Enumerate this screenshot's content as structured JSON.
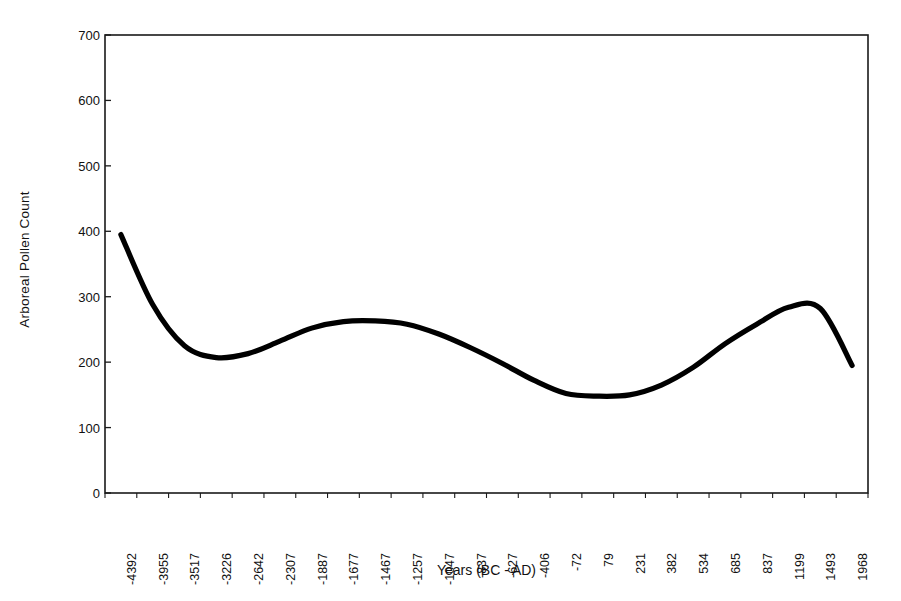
{
  "chart_data": {
    "type": "line",
    "title": "",
    "xlabel": "Years (BC - AD)",
    "ylabel": "Arboreal Pollen Count",
    "ylim": [
      0,
      700
    ],
    "y_ticks": [
      0,
      100,
      200,
      300,
      400,
      500,
      600,
      700
    ],
    "grid": false,
    "legend": null,
    "line_color": "#000000",
    "line_width": 5,
    "smoothing": "smoothed trend curve",
    "categories": [
      "-4392",
      "-3955",
      "-3517",
      "-3226",
      "-2642",
      "-2307",
      "-1887",
      "-1677",
      "-1467",
      "-1257",
      "-1047",
      "-837",
      "-627",
      "-406",
      "-72",
      "79",
      "231",
      "382",
      "534",
      "685",
      "837",
      "1199",
      "1493",
      "1968"
    ],
    "series": [
      {
        "name": "Arboreal Pollen Count",
        "values": [
          395,
          288,
          225,
          207,
          213,
          232,
          252,
          262,
          263,
          258,
          243,
          222,
          198,
          172,
          152,
          148,
          150,
          165,
          192,
          228,
          258,
          284,
          282,
          195
        ]
      }
    ],
    "annotations": []
  },
  "axes": {
    "y_title": "Arboreal Pollen Count",
    "x_title": "Years (BC - AD)",
    "y_tick_labels": [
      "700",
      "600",
      "500",
      "400",
      "300",
      "200",
      "100",
      "0"
    ],
    "x_tick_labels": [
      "-4392",
      "-3955",
      "-3517",
      "-3226",
      "-2642",
      "-2307",
      "-1887",
      "-1677",
      "-1467",
      "-1257",
      "-1047",
      "-837",
      "-627",
      "-406",
      "-72",
      "79",
      "231",
      "382",
      "534",
      "685",
      "837",
      "1199",
      "1493",
      "1968"
    ]
  },
  "style": {
    "background": "#ffffff",
    "axis_color": "#1a1a1a",
    "line_color": "#000000"
  }
}
